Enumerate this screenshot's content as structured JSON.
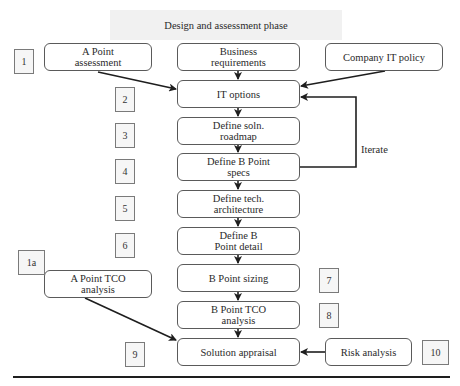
{
  "title": "Design and assessment phase",
  "flow": [
    {
      "id": "business",
      "text_lines": [
        "Business",
        "requirements"
      ]
    },
    {
      "id": "it_options",
      "text_lines": [
        "IT options"
      ]
    },
    {
      "id": "roadmap",
      "text_lines": [
        "Define soln.",
        "roadmap"
      ]
    },
    {
      "id": "bspecs",
      "text_lines": [
        "Define B Point",
        "specs"
      ]
    },
    {
      "id": "arch",
      "text_lines": [
        "Define tech.",
        "architecture"
      ]
    },
    {
      "id": "bdetail",
      "text_lines": [
        "Define B",
        "Point detail"
      ]
    },
    {
      "id": "bsizing",
      "text_lines": [
        "B Point sizing"
      ]
    },
    {
      "id": "btco",
      "text_lines": [
        "B Point TCO",
        "analysis"
      ]
    },
    {
      "id": "appraisal",
      "text_lines": [
        "Solution appraisal"
      ]
    }
  ],
  "side_nodes": {
    "a_assessment": {
      "text_lines": [
        "A Point",
        "assessment"
      ]
    },
    "it_policy": {
      "text_lines": [
        "Company IT policy"
      ]
    },
    "a_tco": {
      "text_lines": [
        "A Point TCO",
        "analysis"
      ]
    },
    "risk": {
      "text_lines": [
        "Risk analysis"
      ]
    }
  },
  "step_numbers": {
    "n1": "1",
    "n2": "2",
    "n3": "3",
    "n4": "4",
    "n5": "5",
    "n6": "6",
    "n1a": "1a",
    "n7": "7",
    "n8": "8",
    "n9": "9",
    "n10": "10"
  },
  "iterate_label": "Iterate",
  "edges": [
    {
      "from": "business",
      "to": "it_options"
    },
    {
      "from": "it_options",
      "to": "roadmap"
    },
    {
      "from": "roadmap",
      "to": "bspecs"
    },
    {
      "from": "bspecs",
      "to": "arch"
    },
    {
      "from": "arch",
      "to": "bdetail"
    },
    {
      "from": "bdetail",
      "to": "bsizing"
    },
    {
      "from": "bsizing",
      "to": "btco"
    },
    {
      "from": "btco",
      "to": "appraisal"
    },
    {
      "from": "a_assessment",
      "to": "it_options"
    },
    {
      "from": "it_policy",
      "to": "it_options"
    },
    {
      "from": "bspecs",
      "to": "it_options",
      "label": "Iterate"
    },
    {
      "from": "a_tco",
      "to": "appraisal"
    },
    {
      "from": "risk",
      "to": "appraisal"
    }
  ],
  "colors": {
    "line": "#1e1e1e",
    "box_border": "#5a5a5a",
    "title_band": "#f1f1f1"
  }
}
